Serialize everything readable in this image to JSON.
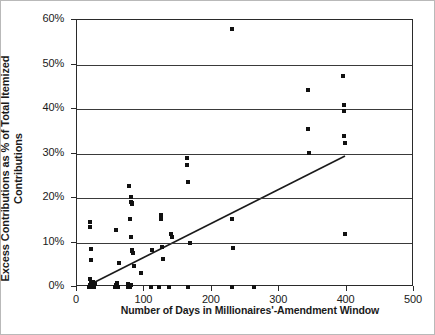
{
  "chart_data": {
    "type": "scatter",
    "title": "",
    "xlabel": "Number of Days in Millionaires'-Amendment Window",
    "ylabel_lines": [
      "Excess Contributions as % of Total Itemized",
      "Contributions"
    ],
    "ylabel": "Excess Contributions as % of Total Itemized Contributions",
    "xlim": [
      0,
      500
    ],
    "ylim": [
      0,
      60
    ],
    "xticks": [
      0,
      100,
      200,
      300,
      400,
      500
    ],
    "xtick_labels": [
      "0",
      "100",
      "200",
      "300",
      "400",
      "500"
    ],
    "yticks": [
      0,
      10,
      20,
      30,
      40,
      50,
      60
    ],
    "ytick_labels": [
      "0%",
      "10%",
      "20%",
      "30%",
      "40%",
      "50%",
      "60%"
    ],
    "grid": "horizontal",
    "legend": "none",
    "marker": "square",
    "marker_color": "#111111",
    "frame_color": "#2a2a2a",
    "series": [
      {
        "name": "Campaigns",
        "points": [
          [
            18,
            0.0
          ],
          [
            19,
            0.4
          ],
          [
            20,
            0.0
          ],
          [
            21,
            0.8
          ],
          [
            22,
            0.0
          ],
          [
            23,
            1.2
          ],
          [
            20,
            1.8
          ],
          [
            24,
            0.5
          ],
          [
            19,
            14.6
          ],
          [
            20,
            13.4
          ],
          [
            21,
            8.5
          ],
          [
            21,
            6.0
          ],
          [
            25,
            0.0
          ],
          [
            26,
            0.6
          ],
          [
            57,
            0.0
          ],
          [
            58,
            0.5
          ],
          [
            59,
            0.0
          ],
          [
            60,
            1.0
          ],
          [
            61,
            0.0
          ],
          [
            58,
            12.7
          ],
          [
            62,
            5.4
          ],
          [
            75,
            0.0
          ],
          [
            76,
            0.6
          ],
          [
            78,
            0.0
          ],
          [
            79,
            0.0
          ],
          [
            80,
            0.5
          ],
          [
            77,
            22.8
          ],
          [
            80,
            20.2
          ],
          [
            80,
            19.2
          ],
          [
            81,
            18.9
          ],
          [
            81,
            18.6
          ],
          [
            79,
            15.3
          ],
          [
            80,
            11.2
          ],
          [
            81,
            8.3
          ],
          [
            82,
            8.0
          ],
          [
            83,
            7.6
          ],
          [
            84,
            4.8
          ],
          [
            95,
            3.1
          ],
          [
            110,
            0.0
          ],
          [
            112,
            8.4
          ],
          [
            122,
            0.0
          ],
          [
            124,
            16.1
          ],
          [
            125,
            15.2
          ],
          [
            126,
            8.9
          ],
          [
            128,
            6.3
          ],
          [
            136,
            0.0
          ],
          [
            140,
            11.9
          ],
          [
            141,
            11.3
          ],
          [
            165,
            0.0
          ],
          [
            163,
            29.0
          ],
          [
            163,
            27.5
          ],
          [
            164,
            23.5
          ],
          [
            167,
            10.0
          ],
          [
            230,
            0.0
          ],
          [
            230,
            58.0
          ],
          [
            230,
            15.3
          ],
          [
            231,
            8.7
          ],
          [
            263,
            0.0
          ],
          [
            342,
            44.3
          ],
          [
            343,
            35.4
          ],
          [
            344,
            30.1
          ],
          [
            395,
            47.4
          ],
          [
            396,
            41.0
          ],
          [
            396,
            39.6
          ],
          [
            396,
            33.9
          ],
          [
            397,
            32.4
          ],
          [
            398,
            11.8
          ]
        ]
      }
    ],
    "trendline": {
      "name": "linear fit",
      "x_start": 18,
      "y_start": 0.0,
      "x_end": 400,
      "y_end": 29.2,
      "color": "#1a1a1a"
    }
  }
}
